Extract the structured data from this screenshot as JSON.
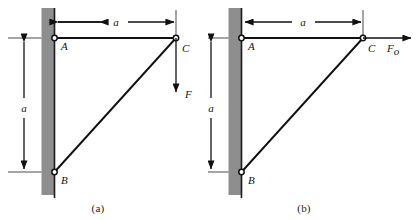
{
  "figure": {
    "background_color": "#ffffff",
    "line_color": "#111111",
    "wall_color": "#8e8e8e",
    "panels": [
      {
        "id": "a",
        "caption": "(a)",
        "joints": [
          {
            "name": "A",
            "label": "A"
          },
          {
            "name": "B",
            "label": "B"
          },
          {
            "name": "C",
            "label": "C"
          }
        ],
        "dimensions": [
          {
            "name": "horizontal-span-a",
            "label": "a",
            "orientation": "horizontal"
          },
          {
            "name": "vertical-span-a",
            "label": "a",
            "orientation": "vertical"
          }
        ],
        "load": {
          "label": "F",
          "subscript": "",
          "direction": "down",
          "applied_at": "C"
        }
      },
      {
        "id": "b",
        "caption": "(b)",
        "joints": [
          {
            "name": "A",
            "label": "A"
          },
          {
            "name": "B",
            "label": "B"
          },
          {
            "name": "C",
            "label": "C"
          }
        ],
        "dimensions": [
          {
            "name": "horizontal-span-a",
            "label": "a",
            "orientation": "horizontal"
          },
          {
            "name": "vertical-span-a",
            "label": "a",
            "orientation": "vertical"
          }
        ],
        "load": {
          "label": "F",
          "subscript": "o",
          "direction": "right",
          "applied_at": "C"
        }
      }
    ]
  }
}
